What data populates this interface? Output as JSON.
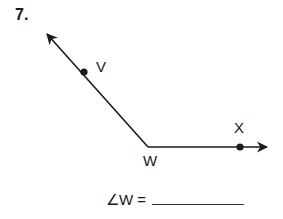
{
  "problem": {
    "number": "7.",
    "answer_prompt": "∠W =",
    "answer_value": ""
  },
  "figure": {
    "type": "angle",
    "vertex": {
      "label": "W",
      "x": 148,
      "y": 147
    },
    "points": [
      {
        "label": "V",
        "x": 84,
        "y": 72
      },
      {
        "label": "X",
        "x": 240,
        "y": 147
      }
    ],
    "rays": [
      {
        "from": "W",
        "through": "V",
        "end": {
          "x": 46,
          "y": 33
        }
      },
      {
        "from": "W",
        "through": "X",
        "end": {
          "x": 268,
          "y": 147
        }
      }
    ],
    "stroke_color": "#1a1a1a"
  }
}
